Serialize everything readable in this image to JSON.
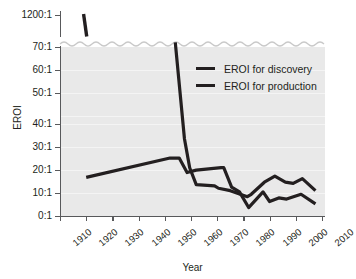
{
  "chart_data": {
    "type": "line",
    "title": "",
    "xlabel": "Year",
    "ylabel": "EROI",
    "xlim": [
      1910,
      2010
    ],
    "ylim": [
      0,
      70
    ],
    "y_axis_break": true,
    "y_break_note": "axis broken between 70:1 and 1200:1",
    "grid": true,
    "legend_position": "top-right-inside",
    "xticks": [
      1910,
      1920,
      1930,
      1940,
      1950,
      1960,
      1970,
      1980,
      1990,
      2000,
      2010
    ],
    "xtick_labels": [
      "1910",
      "1920",
      "1930",
      "1940",
      "1950",
      "1960",
      "1970",
      "1980",
      "1990",
      "2000",
      "2010"
    ],
    "yticks": [
      0,
      10,
      20,
      30,
      40,
      50,
      60,
      70,
      1200
    ],
    "ytick_labels": [
      "0:1",
      "10:1",
      "20:1",
      "30:1",
      "40:1",
      "50:1",
      "60:1",
      "70:1",
      "1200:1"
    ],
    "series": [
      {
        "name": "EROI for discovery",
        "color": "#231f20",
        "segments": [
          {
            "note": "upper segment above axis break",
            "points": [
              {
                "x": 1919.0,
                "y": 1200
              },
              {
                "x": 1920.2,
                "y": 130
              }
            ]
          },
          {
            "note": "main curve entering below axis break",
            "points": [
              {
                "x": 1954.0,
                "y": 72
              },
              {
                "x": 1957.5,
                "y": 32
              },
              {
                "x": 1959.5,
                "y": 20
              },
              {
                "x": 1962.0,
                "y": 13
              },
              {
                "x": 1969.0,
                "y": 12.5
              },
              {
                "x": 1970.5,
                "y": 11.5
              },
              {
                "x": 1975.0,
                "y": 10.5
              },
              {
                "x": 1981.5,
                "y": 8
              },
              {
                "x": 1983.0,
                "y": 9
              },
              {
                "x": 1988.0,
                "y": 14
              },
              {
                "x": 1992.0,
                "y": 16.5
              },
              {
                "x": 1996.0,
                "y": 14
              },
              {
                "x": 1999.0,
                "y": 13.5
              },
              {
                "x": 2002.5,
                "y": 15.5
              },
              {
                "x": 2007.5,
                "y": 10.5
              }
            ]
          }
        ]
      },
      {
        "name": "EROI for production",
        "color": "#231f20",
        "segments": [
          {
            "note": "single continuous curve",
            "points": [
              {
                "x": 1920.0,
                "y": 16
              },
              {
                "x": 1952.0,
                "y": 24
              },
              {
                "x": 1955.5,
                "y": 24
              },
              {
                "x": 1958.5,
                "y": 18
              },
              {
                "x": 1962.0,
                "y": 19
              },
              {
                "x": 1971.5,
                "y": 20
              },
              {
                "x": 1972.5,
                "y": 20
              },
              {
                "x": 1975.5,
                "y": 12
              },
              {
                "x": 1978.5,
                "y": 10
              },
              {
                "x": 1982.0,
                "y": 3.5
              },
              {
                "x": 1987.5,
                "y": 10
              },
              {
                "x": 1990.0,
                "y": 6
              },
              {
                "x": 1993.5,
                "y": 7.5
              },
              {
                "x": 1996.5,
                "y": 7
              },
              {
                "x": 2002.0,
                "y": 9
              },
              {
                "x": 2007.5,
                "y": 5
              }
            ]
          }
        ]
      }
    ],
    "legend": [
      {
        "label": "EROI for discovery",
        "color": "#231f20"
      },
      {
        "label": "EROI for production",
        "color": "#231f20"
      }
    ],
    "colors": {
      "line": "#231f20",
      "plot_background": "#e9e9e9",
      "axis": "#58595b",
      "gridline": "#f4f4f4",
      "text": "#231f20",
      "page_background": "#ffffff"
    }
  }
}
